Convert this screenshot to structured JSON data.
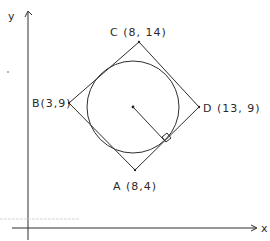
{
  "diagram": {
    "title": "",
    "axes": {
      "x_label": "x",
      "y_label": "y"
    },
    "points": {
      "A": {
        "label": "A (8,4)",
        "coords": [
          8,
          4
        ]
      },
      "B": {
        "label": "B(3,9)",
        "coords": [
          3,
          9
        ]
      },
      "C": {
        "label": "C (8, 14)",
        "coords": [
          8,
          14
        ]
      },
      "D": {
        "label": "D (13, 9)",
        "coords": [
          13,
          9
        ]
      }
    },
    "shapes": [
      {
        "type": "square",
        "vertices": [
          "A",
          "B",
          "C",
          "D"
        ]
      },
      {
        "type": "circle",
        "description": "inscribed circle tangent to all four sides"
      },
      {
        "type": "segment",
        "description": "radius from center perpendicular to side AD",
        "right_angle_marker": true
      }
    ],
    "colors": {
      "ink": "#2e2e2e",
      "background": "#ffffff"
    }
  }
}
